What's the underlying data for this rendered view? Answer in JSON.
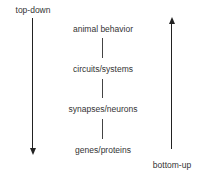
{
  "diagram": {
    "left_arrow": {
      "label": "top-down",
      "direction": "down"
    },
    "right_arrow": {
      "label": "bottom-up",
      "direction": "up"
    },
    "levels": [
      "animal behavior",
      "circuits/systems",
      "synapses/neurons",
      "genes/proteins"
    ],
    "colors": {
      "text": "#333333",
      "line": "#444444",
      "arrow": "#222222",
      "background": "#ffffff"
    }
  }
}
